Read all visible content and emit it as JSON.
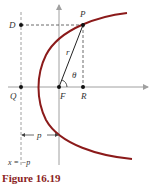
{
  "diagram": {
    "labels": {
      "D": "D",
      "P": "P",
      "Q": "Q",
      "F": "F",
      "R": "R",
      "r": "r",
      "theta": "θ",
      "p": "p",
      "directrix": "x = −p"
    },
    "caption": "Figure 16.19",
    "colors": {
      "curve": "#8b1a1a",
      "axis": "#a0a0a0",
      "dashed": "#555555",
      "caption": "#8b2323"
    }
  }
}
